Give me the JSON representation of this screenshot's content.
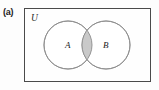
{
  "figure": {
    "part_label": "(a)",
    "type": "venn-diagram",
    "shaded_region_meaning": "A intersect B",
    "universe": {
      "label": "U",
      "rect": {
        "x": 24,
        "y": 8,
        "width": 127,
        "height": 74
      },
      "border_color": "#4a4a4a",
      "fill_color": "#fefefe"
    },
    "sets": [
      {
        "name": "A",
        "label": "A",
        "cx": 68,
        "cy": 45,
        "r": 24,
        "label_x": 65,
        "label_y": 48,
        "stroke_color": "#8c8c8c",
        "fill_color": "#ffffff"
      },
      {
        "name": "B",
        "label": "B",
        "cx": 106,
        "cy": 45,
        "r": 24,
        "label_x": 103,
        "label_y": 48,
        "stroke_color": "#8c8c8c",
        "fill_color": "#ffffff"
      }
    ],
    "intersection": {
      "label": "",
      "fill_color": "#c9c9c9",
      "stroke_color": "#8c8c8c"
    }
  }
}
